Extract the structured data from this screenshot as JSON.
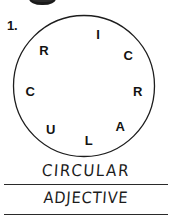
{
  "worksheet": {
    "question_number": "1.",
    "puzzle": {
      "name": "circle-word-puzzle",
      "shape": "circle",
      "letters": [
        {
          "char": "I",
          "angle_deg": 285
        },
        {
          "char": "C",
          "angle_deg": 325
        },
        {
          "char": "R",
          "angle_deg": 5
        },
        {
          "char": "A",
          "angle_deg": 48
        },
        {
          "char": "L",
          "angle_deg": 85
        },
        {
          "char": "U",
          "angle_deg": 128
        },
        {
          "char": "C",
          "angle_deg": 175
        },
        {
          "char": "R",
          "angle_deg": 222
        }
      ],
      "solution": "CIRCULAR"
    },
    "answers": [
      {
        "label": "word-answer",
        "text": "CIRCULAR"
      },
      {
        "label": "part-of-speech-answer",
        "text": "ADJECTIVE"
      }
    ],
    "colors": {
      "ink": "#121212",
      "handwriting": "#1b1b1b",
      "rule_line": "#2a2a2a",
      "paper": "#ffffff"
    }
  }
}
